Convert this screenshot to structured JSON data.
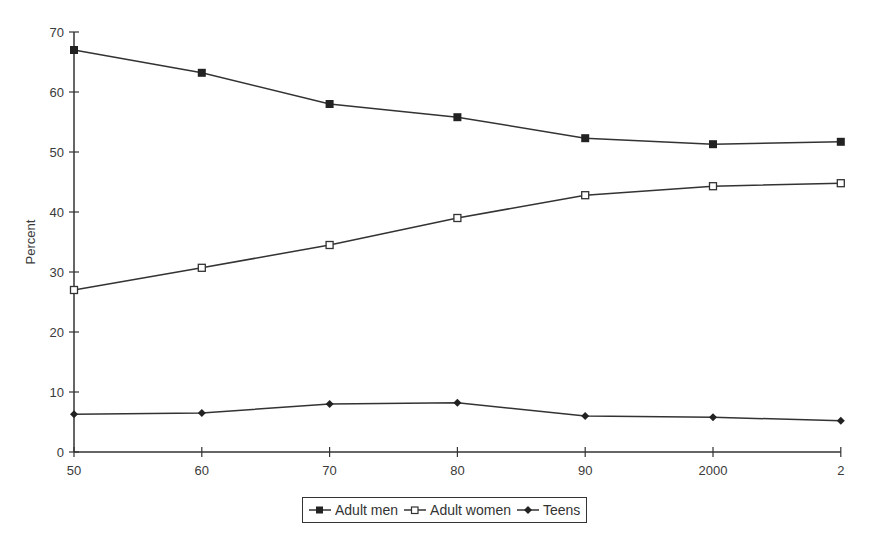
{
  "chart_data": {
    "type": "line",
    "title": "",
    "xlabel": "",
    "ylabel": "Percent",
    "categories": [
      "50",
      "60",
      "70",
      "80",
      "90",
      "2000",
      "2"
    ],
    "ylim": [
      0,
      70
    ],
    "yticks": [
      0,
      10,
      20,
      30,
      40,
      50,
      60,
      70
    ],
    "grid": false,
    "legend_position": "bottom",
    "series": [
      {
        "name": "Adult men",
        "marker": "filled-square",
        "values": [
          67.0,
          63.2,
          58.0,
          55.8,
          52.3,
          51.3,
          51.7
        ]
      },
      {
        "name": "Adult women",
        "marker": "open-square",
        "values": [
          27.0,
          30.7,
          34.5,
          39.0,
          42.8,
          44.3,
          44.8
        ]
      },
      {
        "name": "Teens",
        "marker": "filled-diamond",
        "values": [
          6.3,
          6.5,
          8.0,
          8.2,
          6.0,
          5.8,
          5.2
        ]
      }
    ]
  },
  "legend": {
    "items": [
      {
        "label": "Adult men"
      },
      {
        "label": "Adult women"
      },
      {
        "label": "Teens"
      }
    ]
  },
  "colors": {
    "line": "#333333",
    "text": "#3a3a3a"
  }
}
